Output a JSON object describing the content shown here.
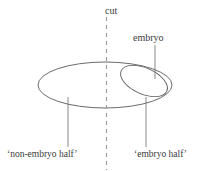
{
  "figure": {
    "background_color": "#ffffff",
    "stroke_color": "#5a5a5a",
    "text_color": "#3a3a3a",
    "labels": {
      "cut": "cut",
      "embryo": "embryo",
      "non_embryo_half": "‘non-embryo half’",
      "embryo_half": "‘embryo half’"
    },
    "shapes": {
      "outer_ellipse_name": "egg-outline",
      "inner_ellipse_name": "embryo-region",
      "cut_line_style": "dashed-vertical"
    }
  }
}
